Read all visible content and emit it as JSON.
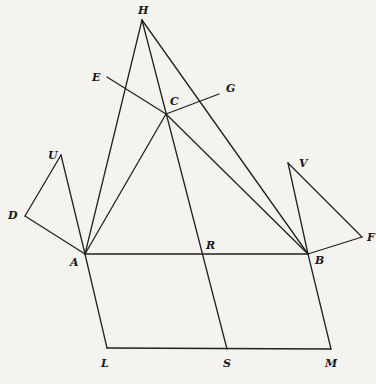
{
  "figure": {
    "background": "#f4f3ef",
    "stroke": "#222222",
    "points": {
      "H": [
        142,
        20
      ],
      "E": [
        107,
        77
      ],
      "C": [
        166,
        114
      ],
      "G": [
        219,
        94
      ],
      "U": [
        61,
        155
      ],
      "D": [
        25,
        216
      ],
      "A": [
        85,
        254
      ],
      "V": [
        288,
        163
      ],
      "F": [
        362,
        237
      ],
      "B": [
        308,
        254
      ],
      "R": [
        205,
        254
      ],
      "L": [
        107,
        348
      ],
      "S": [
        227,
        349
      ],
      "M": [
        331,
        349
      ]
    },
    "segments": [
      [
        "H",
        "A"
      ],
      [
        "H",
        "B"
      ],
      [
        "H",
        "S"
      ],
      [
        "E",
        "C"
      ],
      [
        "C",
        "G"
      ],
      [
        "C",
        "A"
      ],
      [
        "C",
        "B"
      ],
      [
        "U",
        "A"
      ],
      [
        "D",
        "A"
      ],
      [
        "D",
        "U"
      ],
      [
        "V",
        "B"
      ],
      [
        "F",
        "B"
      ],
      [
        "F",
        "V"
      ],
      [
        "A",
        "B"
      ],
      [
        "A",
        "L"
      ],
      [
        "L",
        "M"
      ],
      [
        "M",
        "B"
      ]
    ],
    "labels": [
      {
        "id": "H",
        "text": "H",
        "x": 138,
        "y": 14
      },
      {
        "id": "E",
        "text": "E",
        "x": 92,
        "y": 81
      },
      {
        "id": "C",
        "text": "C",
        "x": 170,
        "y": 105
      },
      {
        "id": "G",
        "text": "G",
        "x": 226,
        "y": 92
      },
      {
        "id": "U",
        "text": "U",
        "x": 48,
        "y": 159
      },
      {
        "id": "D",
        "text": "D",
        "x": 8,
        "y": 219
      },
      {
        "id": "A",
        "text": "A",
        "x": 70,
        "y": 266
      },
      {
        "id": "V",
        "text": "V",
        "x": 299,
        "y": 167
      },
      {
        "id": "F",
        "text": "F",
        "x": 367,
        "y": 241
      },
      {
        "id": "B",
        "text": "B",
        "x": 315,
        "y": 264
      },
      {
        "id": "R",
        "text": "R",
        "x": 206,
        "y": 249
      },
      {
        "id": "L",
        "text": "L",
        "x": 101,
        "y": 367
      },
      {
        "id": "S",
        "text": "S",
        "x": 223,
        "y": 367
      },
      {
        "id": "M",
        "text": "M",
        "x": 325,
        "y": 367
      }
    ]
  }
}
